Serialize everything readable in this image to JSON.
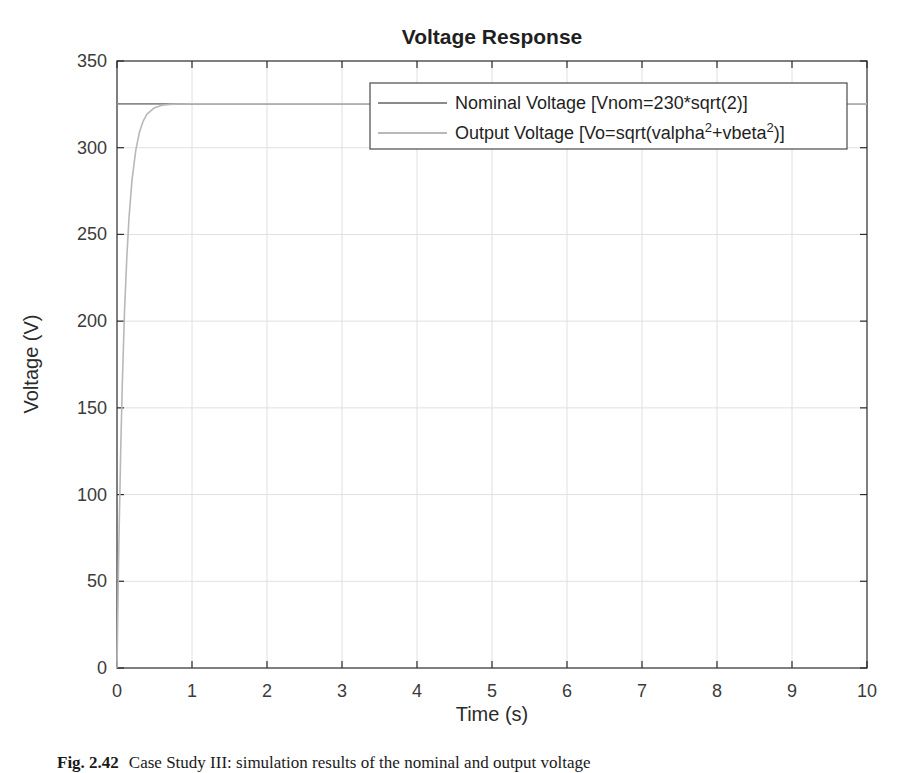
{
  "figure": {
    "caption": {
      "label": "Fig. 2.42",
      "text": "Case Study III: simulation results of the nominal and output voltage"
    }
  },
  "chart_data": {
    "type": "line",
    "title": "Voltage Response",
    "xlabel": "Time (s)",
    "ylabel": "Voltage (V)",
    "xlim": [
      0,
      10
    ],
    "ylim": [
      0,
      350
    ],
    "xticks": [
      0,
      1,
      2,
      3,
      4,
      5,
      6,
      7,
      8,
      9,
      10
    ],
    "yticks": [
      0,
      50,
      100,
      150,
      200,
      250,
      300,
      350
    ],
    "grid": true,
    "legend_position": "inside-top-right",
    "legend": {
      "entries": [
        {
          "name": "Nominal Voltage [Vnom=230*sqrt(2)]",
          "color": "#8a8a8a",
          "parts": [
            {
              "t": "Nominal Voltage [Vnom=230*sqrt(2)]",
              "sup": false
            }
          ]
        },
        {
          "name": "Output Voltage [Vo=sqrt(valpha^2+vbeta^2)]",
          "color": "#b8b8b8",
          "parts": [
            {
              "t": "Output Voltage [Vo=sqrt(valpha",
              "sup": false
            },
            {
              "t": "2",
              "sup": true
            },
            {
              "t": "+vbeta",
              "sup": false
            },
            {
              "t": "2",
              "sup": true
            },
            {
              "t": ")]",
              "sup": false
            }
          ]
        }
      ]
    },
    "series": [
      {
        "name": "Nominal Voltage [Vnom=230*sqrt(2)]",
        "color": "#8a8a8a",
        "width": 1.8,
        "x": [
          0,
          10
        ],
        "y": [
          325.27,
          325.27
        ]
      },
      {
        "name": "Output Voltage [Vo=sqrt(valpha^2+vbeta^2)]",
        "color": "#b8b8b8",
        "width": 1.6,
        "x": [
          0,
          0.01,
          0.02,
          0.03,
          0.05,
          0.07,
          0.1,
          0.13,
          0.16,
          0.2,
          0.25,
          0.3,
          0.35,
          0.4,
          0.5,
          0.6,
          0.7,
          0.8,
          1,
          1.5,
          2,
          3,
          4,
          5,
          6,
          7,
          8,
          9,
          10
        ],
        "y": [
          0,
          31,
          59,
          84.3,
          128,
          163.7,
          205.6,
          236.6,
          259.6,
          281.3,
          298.6,
          309.1,
          315.5,
          319.3,
          323.1,
          324.5,
          325,
          325.2,
          325.3,
          325.3,
          325.3,
          325.3,
          325.3,
          325.3,
          325.3,
          325.3,
          325.3,
          325.3,
          325.3
        ]
      }
    ],
    "colors": {
      "axis": "#2b2b2b",
      "grid": "#e0e0e0",
      "tick_label": "#3b3b3b",
      "title": "#1f1f1f",
      "legend_border": "#4a4a4a",
      "legend_background": "#ffffff"
    }
  }
}
